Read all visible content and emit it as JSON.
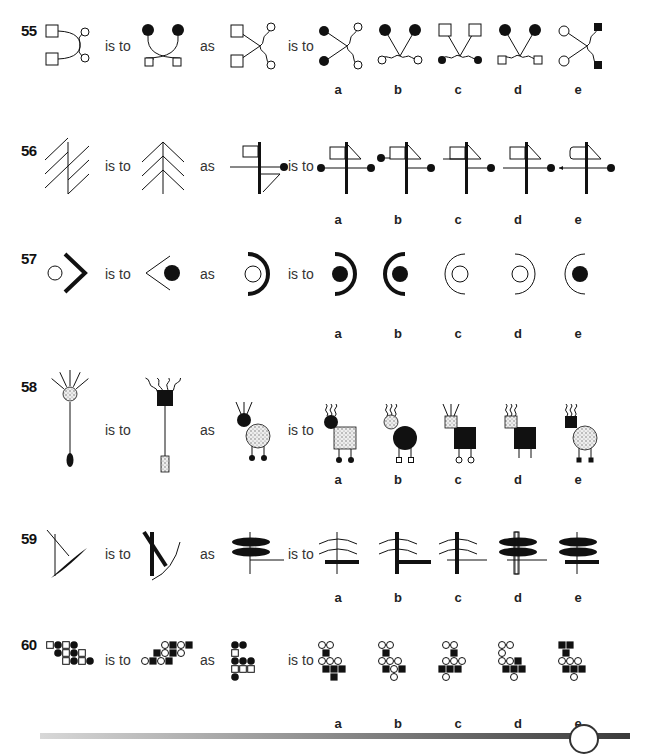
{
  "connectors": {
    "is_to": "is to",
    "as": "as"
  },
  "option_letters": [
    "a",
    "b",
    "c",
    "d",
    "e"
  ],
  "questions": [
    {
      "number": "55",
      "top": 22,
      "figures": {
        "A": "55A",
        "B": "55B",
        "C": "55C",
        "options": [
          "55a",
          "55b",
          "55c",
          "55d",
          "55e"
        ]
      },
      "descriptions": {
        "A": "two open squares linked by crossing arcs to two open circles",
        "B": "two filled circles above, crossing arcs, two small open squares below",
        "C": "two open squares with lines crossing to two wavy lines ending in open circles",
        "options": [
          "filled circles left, wavy lines to open circles right",
          "filled circles top, wavy lines to open circles bottom",
          "open squares top, wavy lines to filled circles bottom",
          "filled circles top, wavy lines to open squares bottom",
          "open circles left, wavy lines to filled squares right"
        ]
      }
    },
    {
      "number": "56",
      "top": 142,
      "figures": {
        "A": "56A",
        "B": "56B",
        "C": "56C",
        "options": [
          "56a",
          "56b",
          "56c",
          "56d",
          "56e"
        ]
      },
      "descriptions": {
        "A": "vertical line with three parallel diagonals each side",
        "B": "vertical line with three chevrons (tree shape)",
        "C": "thick vertical bar, flag at top left, horizontal line to dot right, triangle lower right",
        "options": [
          "flag with triangle top, horizontal line with dots both ends",
          "flag with triangle top, dot top-left, line to dot right lower",
          "flag with triangle top, line on left top, line to dot right",
          "flag with triangle top, horizontal line to dot right",
          "rounded flag with triangle, arrow line left, dot right"
        ]
      }
    },
    {
      "number": "57",
      "top": 250,
      "figures": {
        "A": "57A",
        "B": "57B",
        "C": "57C",
        "options": [
          "57a",
          "57b",
          "57c",
          "57d",
          "57e"
        ]
      },
      "descriptions": {
        "A": "open circle with thick chevron right",
        "B": "thin chevron left with filled circle",
        "C": "open circle with thick arc right",
        "options": [
          "filled circle, thick arc right",
          "filled circle, thick arc left",
          "open circle, thin arc left",
          "open circle, thin arc right",
          "filled circle, thin arc left"
        ]
      }
    },
    {
      "number": "58",
      "top": 378,
      "figures": {
        "A": "58A",
        "B": "58B",
        "C": "58C",
        "options": [
          "58a",
          "58b",
          "58c",
          "58d",
          "58e"
        ]
      },
      "descriptions": {
        "A": "dotted circle with straight rays on stem with filled oval",
        "B": "filled square with wavy rays on stem with dotted rectangle",
        "C": "filled circle with straight rays, dotted large circle with two filled feet",
        "options": [
          "filled circle wavy rays, dotted square body, filled round feet",
          "dotted circle wavy rays, filled large circle body, open square feet",
          "dotted square straight rays, filled square body, open round feet",
          "dotted square wavy rays, filled square body, dotted square feet",
          "filled square wavy rays, dotted large circle body, filled square feet"
        ]
      }
    },
    {
      "number": "59",
      "top": 530,
      "figures": {
        "A": "59A",
        "B": "59B",
        "C": "59C",
        "options": [
          "59a",
          "59b",
          "59c",
          "59d",
          "59e"
        ]
      },
      "descriptions": {
        "A": "thin vertical, thin diagonal, filled leaf diagonal",
        "B": "thick bar diagonal on thick vertical with thin arc",
        "C": "two filled leaves on thin vertical, thin L line",
        "options": [
          "two arcs on thin vertical, thick horizontal bar",
          "two arcs on thick vertical, thick L bar",
          "two arcs on thick vertical, thin horizontal",
          "two filled leaves on open bar, thin horizontal",
          "two filled leaves on thin vertical, thick horizontal bar"
        ]
      }
    },
    {
      "number": "60",
      "top": 636,
      "figures": {
        "A": "60A",
        "B": "60B",
        "C": "60C",
        "options": [
          "60a",
          "60b",
          "60c",
          "60d",
          "60e"
        ]
      },
      "descriptions": {
        "A": "grid of open squares and filled circles",
        "B": "grid of open circles and filled squares",
        "C": "cross of filled circles and open squares",
        "options": [
          "open circles and filled squares variant a",
          "open circles and filled squares variant b",
          "open circles and filled squares variant c",
          "open circles and filled squares variant d",
          "open circles and filled squares variant e"
        ]
      }
    }
  ],
  "grids": {
    "60A": [
      "s.c.s.c...",
      "..c.s.c.s.",
      "....s.c.s.c"
    ],
    "60B": [
      ".....o.S.o.S",
      "...S.o.S.o",
      "o.S.o.S"
    ],
    "60C": [
      "c c",
      "s",
      "c c c",
      "s s s",
      "c"
    ],
    "60a": [
      "o o",
      " S",
      "o o o",
      " S S S",
      "   S"
    ],
    "60b": [
      "o o",
      " S",
      "o o o",
      " S o S",
      "   o"
    ],
    "60c": [
      " o o",
      "   S",
      " o o o",
      "S S S",
      " o"
    ],
    "60d": [
      "o o",
      "o",
      "o o S",
      " S S S",
      "   o"
    ],
    "60e": [
      "S S",
      " S",
      "o o o",
      " S S S",
      "   o"
    ]
  },
  "footer": {
    "tab_label": ""
  }
}
